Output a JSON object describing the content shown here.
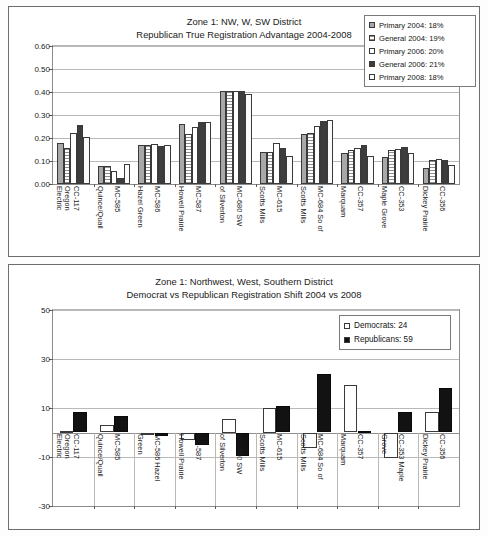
{
  "chart_data": [
    {
      "type": "bar",
      "id": "top",
      "title": "Zone 1: NW, W, SW District",
      "subtitle": "Republican True Registration Advantage 2004-2008",
      "xlabel": "",
      "ylabel": "",
      "ylim": [
        0.0,
        0.6
      ],
      "yticks": [
        "0.00",
        "0.10",
        "0.20",
        "0.30",
        "0.40",
        "0.50",
        "0.60"
      ],
      "grid": true,
      "legend_position": "top-right",
      "categories": [
        "Oregon Electric / CC-117",
        "Quince/Quail / MC-585",
        "Hazel Green / MC-586",
        "Howell Prairie / MC-587",
        "of Silverton / MC-680 SW",
        "Scotts Mills / MC-615",
        "Scotts Mills / MC-684 So of",
        "Marquam / CC-357",
        "Maple Grove / CC-353",
        "Dickey Prairie / CC-356"
      ],
      "xtick_labels": [
        [
          "Electric",
          "Oregon"
        ],
        [
          "CC-117",
          ""
        ],
        [
          "Quince/Quail",
          ""
        ],
        [
          "MC-585",
          ""
        ],
        [
          "Hazel Green",
          ""
        ],
        [
          "MC-586",
          ""
        ],
        [
          "Howell Prairie",
          ""
        ],
        [
          "MC-587",
          ""
        ],
        [
          "of Silverton",
          ""
        ],
        [
          "MC-680 SW",
          ""
        ],
        [
          "Scotts Mills",
          ""
        ],
        [
          "MC-615",
          ""
        ],
        [
          "Scotts Mills",
          ""
        ],
        [
          "MC-684 So of",
          ""
        ],
        [
          "Marquam",
          ""
        ],
        [
          "CC-357",
          ""
        ],
        [
          "Maple Grove",
          ""
        ],
        [
          "CC-353",
          ""
        ],
        [
          "Dickey Prairie",
          ""
        ],
        [
          "CC-356",
          ""
        ]
      ],
      "series": [
        {
          "name": "Primary 2004: 18%",
          "key": "sw-p04",
          "values": [
            0.178,
            0.077,
            0.169,
            0.261,
            0.406,
            0.139,
            0.219,
            0.134,
            0.116,
            0.068
          ]
        },
        {
          "name": "General 2004: 19%",
          "key": "sw-g04",
          "values": [
            0.157,
            0.077,
            0.169,
            0.218,
            0.406,
            0.139,
            0.221,
            0.148,
            0.147,
            0.104
          ]
        },
        {
          "name": "Primary 2006: 20%",
          "key": "sw-p06",
          "values": [
            0.222,
            0.055,
            0.173,
            0.249,
            0.405,
            0.18,
            0.252,
            0.155,
            0.152,
            0.111
          ]
        },
        {
          "name": "General 2006: 21%",
          "key": "sw-g06",
          "values": [
            0.255,
            0.025,
            0.167,
            0.268,
            0.405,
            0.157,
            0.272,
            0.171,
            0.159,
            0.104
          ]
        },
        {
          "name": "Primary 2008: 18%",
          "key": "sw-p08",
          "values": [
            0.205,
            0.088,
            0.168,
            0.269,
            0.39,
            0.12,
            0.278,
            0.123,
            0.136,
            0.082
          ]
        }
      ],
      "legend": [
        {
          "label": "Primary 2004: 18%",
          "key": "sw-p04"
        },
        {
          "label": "General 2004: 19%",
          "key": "sw-g04"
        },
        {
          "label": "Primary 2006: 20%",
          "key": "sw-p06"
        },
        {
          "label": "General 2006: 21%",
          "key": "sw-g06"
        },
        {
          "label": "Primary 2008: 18%",
          "key": "sw-p08"
        }
      ]
    },
    {
      "type": "bar",
      "id": "bottom",
      "title": "Zone 1: Northwest, West, Southern District",
      "subtitle": "Democrat vs Republican Registration Shift 2004 vs 2008",
      "xlabel": "",
      "ylabel": "",
      "ylim": [
        -30,
        50
      ],
      "yticks": [
        "50",
        "30",
        "10",
        "-10",
        "-30"
      ],
      "grid": true,
      "legend_position": "top-right",
      "categories": [
        "Oregon Electric / CC-117",
        "Quince/Quail / MC-585",
        "MC-586 Hazel Green",
        "Howell Prairie / MC-587",
        "of Silverton / MC-680 SW",
        "Scotts Mills / MC-615",
        "Scotts Mills / MC-684 So of",
        "Marquam / CC-357",
        "Grove / CC-353 Maple",
        "Dickey Prairie / CC-356"
      ],
      "xtick_labels": [
        [
          "Electric",
          "Oregon"
        ],
        [
          "CC-117",
          ""
        ],
        [
          "Quince/Quail",
          ""
        ],
        [
          "MC-585",
          ""
        ],
        [
          "Green",
          ""
        ],
        [
          "MC-586 Hazel",
          ""
        ],
        [
          "Howell Prairie",
          ""
        ],
        [
          "MC-587",
          ""
        ],
        [
          "of Silverton",
          ""
        ],
        [
          "MC-680 SW",
          ""
        ],
        [
          "Scotts Mills",
          ""
        ],
        [
          "MC-615",
          ""
        ],
        [
          "Scotts Mills",
          ""
        ],
        [
          "MC-684 So of",
          ""
        ],
        [
          "Marquam",
          ""
        ],
        [
          "CC-357",
          ""
        ],
        [
          "Grove",
          ""
        ],
        [
          "CC-353 Maple",
          ""
        ],
        [
          "Dickey Prairie",
          ""
        ],
        [
          "CC-356",
          ""
        ]
      ],
      "series": [
        {
          "name": "Democrats: 24",
          "key": "sw-dem",
          "values": [
            0.6,
            3.2,
            -1.2,
            -3.2,
            5.5,
            10.2,
            -6.5,
            19.5,
            -10.2,
            8.5
          ]
        },
        {
          "name": "Republicans: 59",
          "key": "sw-rep",
          "values": [
            8.5,
            6.8,
            -1.6,
            -5.2,
            -9.5,
            11.0,
            24.0,
            0.8,
            8.3,
            18.0
          ]
        }
      ],
      "legend": [
        {
          "label": "Democrats: 24",
          "key": "sw-dem"
        },
        {
          "label": "Republicans: 59",
          "key": "sw-rep"
        }
      ]
    }
  ]
}
